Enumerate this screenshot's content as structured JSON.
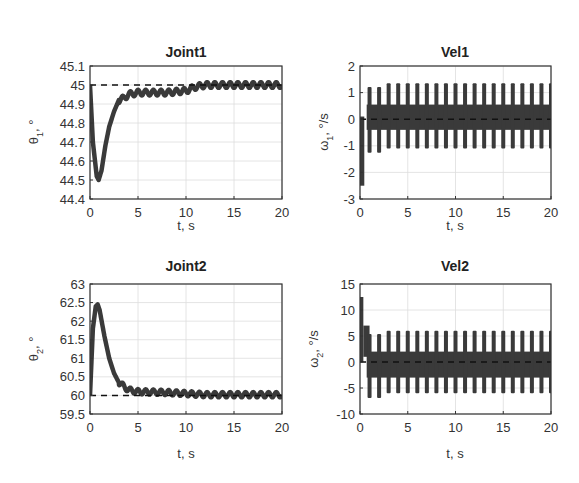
{
  "figure": {
    "width": 579,
    "height": 483,
    "line_color": "#3a3a3a",
    "ref_color": "#111111",
    "grid_color": "#dddddd",
    "frame_color": "#333333"
  },
  "chart_data": [
    {
      "id": "joint1",
      "type": "line",
      "title": "Joint1",
      "xlabel": "t, s",
      "ylabel_main": "θ",
      "ylabel_sub": "1",
      "ylabel_tail": ", °",
      "xlim": [
        0,
        20
      ],
      "ylim": [
        44.4,
        45.1
      ],
      "xticks": [
        0,
        5,
        10,
        15,
        20
      ],
      "xtick_labels": [
        "0",
        "5",
        "10",
        "15",
        "20"
      ],
      "yticks": [
        44.4,
        44.5,
        44.6,
        44.7,
        44.8,
        44.9,
        45,
        45.1
      ],
      "ytick_labels": [
        "44.4",
        "44.5",
        "44.6",
        "44.7",
        "44.8",
        "44.9",
        "45",
        "45.1"
      ],
      "grid": true,
      "box": {
        "x": 90,
        "y": 66,
        "w": 192,
        "h": 133
      },
      "series": [
        {
          "name": "theta1",
          "style": "thick-oscillating",
          "x": [
            0,
            0.3,
            0.7,
            0.9,
            1.2,
            1.6,
            2.0,
            2.5,
            3.0,
            3.5,
            4.0,
            5.0,
            6.0,
            8.0,
            10.0,
            11.0,
            12.0,
            15.0,
            20.0
          ],
          "y": [
            45.0,
            44.7,
            44.52,
            44.5,
            44.55,
            44.68,
            44.78,
            44.86,
            44.92,
            44.93,
            44.95,
            44.96,
            44.96,
            44.96,
            44.97,
            44.99,
            45.0,
            45.0,
            45.0
          ],
          "osc_amp": 0.015,
          "osc_period": 0.8
        },
        {
          "name": "reference",
          "style": "dashed",
          "x": [
            0,
            20
          ],
          "y": [
            45,
            45
          ]
        }
      ]
    },
    {
      "id": "vel1",
      "type": "line",
      "title": "Vel1",
      "xlabel": "t, s",
      "ylabel_main": "ω",
      "ylabel_sub": "1",
      "ylabel_tail": ", °/s",
      "xlim": [
        0,
        20
      ],
      "ylim": [
        -3,
        2
      ],
      "xticks": [
        0,
        5,
        10,
        15,
        20
      ],
      "xtick_labels": [
        "0",
        "5",
        "10",
        "15",
        "20"
      ],
      "yticks": [
        -3,
        -2,
        -1,
        0,
        1,
        2
      ],
      "ytick_labels": [
        "-3",
        "-2",
        "-1",
        "0",
        "1",
        "2"
      ],
      "grid": true,
      "box": {
        "x": 360,
        "y": 66,
        "w": 191,
        "h": 133
      },
      "series": [
        {
          "name": "omega1",
          "style": "bursts",
          "initial_dip": {
            "t": 0.2,
            "min": -2.5
          },
          "burst_period": 1.0,
          "burst_start": 1.0,
          "peak_high": 1.35,
          "peak_low": -1.1,
          "band_high": 0.55,
          "band_low": -0.4
        },
        {
          "name": "reference",
          "style": "dashed",
          "x": [
            0,
            20
          ],
          "y": [
            0,
            0
          ]
        }
      ]
    },
    {
      "id": "joint2",
      "type": "line",
      "title": "Joint2",
      "xlabel": "t, s",
      "ylabel_main": "θ",
      "ylabel_sub": "2",
      "ylabel_tail": ", °",
      "xlim": [
        0,
        20
      ],
      "ylim": [
        59.5,
        63
      ],
      "xticks": [
        0,
        5,
        10,
        15,
        20
      ],
      "xtick_labels": [
        "0",
        "5",
        "10",
        "15",
        "20"
      ],
      "yticks": [
        59.5,
        60,
        60.5,
        61,
        61.5,
        62,
        62.5,
        63
      ],
      "ytick_labels": [
        "59.5",
        "60",
        "60.5",
        "61",
        "61.5",
        "62",
        "62.5",
        "63"
      ],
      "grid": true,
      "box": {
        "x": 90,
        "y": 284,
        "w": 192,
        "h": 130
      },
      "series": [
        {
          "name": "theta2",
          "style": "thick-oscillating",
          "x": [
            0,
            0.3,
            0.6,
            0.8,
            1.0,
            1.5,
            2.0,
            2.5,
            3.0,
            3.5,
            4.0,
            5.0,
            8.0,
            10.0,
            12.0,
            15.0,
            20.0
          ],
          "y": [
            60.0,
            61.8,
            62.4,
            62.45,
            62.3,
            61.6,
            61.0,
            60.6,
            60.35,
            60.25,
            60.15,
            60.1,
            60.08,
            60.05,
            60.02,
            60.02,
            60.02
          ],
          "osc_amp": 0.07,
          "osc_period": 0.8
        },
        {
          "name": "reference",
          "style": "dashed",
          "x": [
            0,
            20
          ],
          "y": [
            60,
            60
          ]
        }
      ]
    },
    {
      "id": "vel2",
      "type": "line",
      "title": "Vel2",
      "xlabel": "t, s",
      "ylabel_main": "ω",
      "ylabel_sub": "2",
      "ylabel_tail": ", °/s",
      "xlim": [
        0,
        20
      ],
      "ylim": [
        -10,
        15
      ],
      "xticks": [
        0,
        5,
        10,
        15,
        20
      ],
      "xtick_labels": [
        "0",
        "5",
        "10",
        "15",
        "20"
      ],
      "yticks": [
        -10,
        -5,
        0,
        5,
        10,
        15
      ],
      "ytick_labels": [
        "-10",
        "-5",
        "0",
        "5",
        "10",
        "15"
      ],
      "grid": true,
      "box": {
        "x": 360,
        "y": 284,
        "w": 191,
        "h": 130
      },
      "series": [
        {
          "name": "omega2",
          "style": "bursts",
          "initial_spike": {
            "t": 0.15,
            "max": 12.5
          },
          "burst_period": 1.0,
          "burst_start": 1.0,
          "peak_high": 6.0,
          "peak_low": -6.0,
          "band_high": 2.0,
          "band_low": -3.0
        },
        {
          "name": "reference",
          "style": "dashed",
          "x": [
            0,
            20
          ],
          "y": [
            0,
            0
          ]
        }
      ]
    }
  ]
}
